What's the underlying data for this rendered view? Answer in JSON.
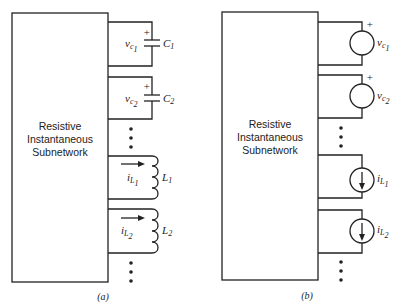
{
  "panels": [
    {
      "caption": "(a)",
      "block_label": [
        "Resistive",
        "Instantaneous",
        "Subnetwork"
      ],
      "elements": [
        {
          "type": "capacitor",
          "voltage": "v",
          "voltage_sub": "c",
          "voltage_sub2": "1",
          "name": "C",
          "name_sub": "1",
          "polarity": "+"
        },
        {
          "type": "capacitor",
          "voltage": "v",
          "voltage_sub": "c",
          "voltage_sub2": "2",
          "name": "C",
          "name_sub": "2",
          "polarity": "+"
        },
        {
          "type": "inductor",
          "current": "i",
          "current_sub": "L",
          "current_sub2": "1",
          "name": "L",
          "name_sub": "1"
        },
        {
          "type": "inductor",
          "current": "i",
          "current_sub": "L",
          "current_sub2": "2",
          "name": "L",
          "name_sub": "2"
        }
      ]
    },
    {
      "caption": "(b)",
      "block_label": [
        "Resistive",
        "Instantaneous",
        "Subnetwork"
      ],
      "elements": [
        {
          "type": "voltage-source",
          "voltage": "v",
          "voltage_sub": "c",
          "voltage_sub2": "1",
          "polarity": "+"
        },
        {
          "type": "voltage-source",
          "voltage": "v",
          "voltage_sub": "c",
          "voltage_sub2": "2",
          "polarity": "+"
        },
        {
          "type": "current-source",
          "current": "i",
          "current_sub": "L",
          "current_sub2": "1"
        },
        {
          "type": "current-source",
          "current": "i",
          "current_sub": "L",
          "current_sub2": "2"
        }
      ]
    }
  ]
}
